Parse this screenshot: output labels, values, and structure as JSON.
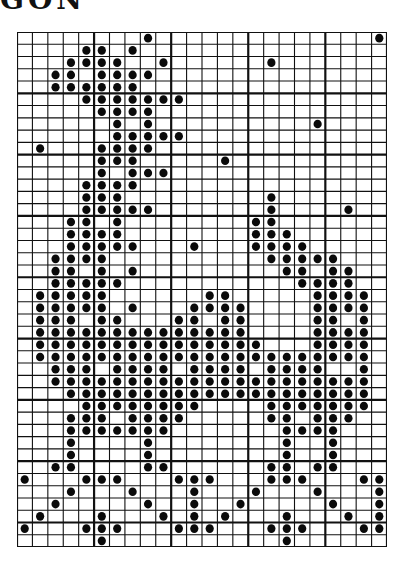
{
  "title": "GON",
  "grid": {
    "columns": 24,
    "rows": 42,
    "major_every": 5,
    "line_color": "#111111",
    "dot_color": "#0a0a0a",
    "background": "#ffffff"
  },
  "pattern": {
    "description": "Cross-stitch chart; each entry lists the column indices (0-based) of filled stitches for that row.",
    "rows": [
      [
        8,
        23
      ],
      [
        4,
        5,
        7
      ],
      [
        3,
        4,
        5,
        6,
        9,
        16
      ],
      [
        2,
        3,
        5,
        6,
        7,
        8
      ],
      [
        2,
        3,
        4,
        5,
        6,
        7
      ],
      [
        4,
        5,
        6,
        7,
        8,
        9,
        10
      ],
      [
        5,
        6,
        7,
        8
      ],
      [
        6,
        8,
        19
      ],
      [
        6,
        7,
        8,
        9,
        10
      ],
      [
        1,
        5,
        6,
        7,
        8
      ],
      [
        5,
        6,
        7,
        13
      ],
      [
        5,
        7,
        8,
        9
      ],
      [
        4,
        5,
        6,
        7
      ],
      [
        4,
        5,
        6,
        16
      ],
      [
        4,
        5,
        6,
        7,
        8,
        16,
        21
      ],
      [
        3,
        4,
        6,
        15,
        16
      ],
      [
        3,
        4,
        5,
        6,
        15,
        16,
        17
      ],
      [
        3,
        4,
        5,
        6,
        7,
        11,
        15,
        16,
        17,
        18
      ],
      [
        2,
        3,
        4,
        5,
        16,
        17,
        18,
        19,
        20
      ],
      [
        2,
        3,
        5,
        7,
        17,
        18,
        20,
        21
      ],
      [
        2,
        3,
        4,
        5,
        6,
        18,
        19,
        20,
        21
      ],
      [
        1,
        2,
        3,
        4,
        5,
        12,
        13,
        19,
        20,
        21,
        22
      ],
      [
        1,
        2,
        3,
        4,
        5,
        7,
        11,
        12,
        13,
        14,
        19,
        20,
        21,
        22
      ],
      [
        1,
        2,
        3,
        5,
        6,
        10,
        11,
        13,
        14,
        19,
        20,
        22
      ],
      [
        1,
        2,
        3,
        4,
        5,
        6,
        7,
        8,
        9,
        10,
        11,
        12,
        13,
        14,
        19,
        20,
        21,
        22
      ],
      [
        1,
        2,
        3,
        4,
        5,
        6,
        7,
        8,
        9,
        10,
        11,
        12,
        13,
        14,
        15,
        19,
        20,
        21,
        22
      ],
      [
        1,
        2,
        3,
        4,
        5,
        6,
        7,
        8,
        9,
        10,
        11,
        12,
        13,
        14,
        15,
        16,
        17,
        18,
        19,
        20,
        21,
        22
      ],
      [
        2,
        3,
        4,
        6,
        7,
        8,
        9,
        11,
        12,
        13,
        14,
        16,
        17,
        18,
        19,
        22
      ],
      [
        2,
        3,
        4,
        5,
        6,
        7,
        8,
        9,
        10,
        11,
        12,
        13,
        14,
        15,
        16,
        17,
        18,
        19,
        20,
        21,
        22
      ],
      [
        3,
        4,
        5,
        6,
        7,
        8,
        9,
        10,
        11,
        12,
        13,
        14,
        15,
        16,
        17,
        18,
        19,
        20,
        21,
        22
      ],
      [
        4,
        5,
        6,
        7,
        8,
        9,
        10,
        11,
        16,
        17,
        18,
        19,
        20,
        21,
        22
      ],
      [
        3,
        4,
        5,
        7,
        8,
        9,
        10,
        16,
        17,
        19,
        20,
        21
      ],
      [
        3,
        4,
        5,
        6,
        7,
        8,
        9,
        17,
        18,
        19,
        20
      ],
      [
        3,
        8,
        17,
        20
      ],
      [
        3,
        8,
        17,
        20
      ],
      [
        2,
        3,
        8,
        9,
        16,
        17,
        19,
        20
      ],
      [
        0,
        4,
        5,
        6,
        10,
        11,
        12,
        16,
        17,
        18,
        22,
        23
      ],
      [
        3,
        7,
        11,
        15,
        19,
        23
      ],
      [
        2,
        8,
        11,
        14,
        20,
        23
      ],
      [
        1,
        5,
        9,
        11,
        13,
        17,
        21,
        23
      ],
      [
        0,
        4,
        5,
        6,
        10,
        11,
        12,
        16,
        17,
        18,
        22,
        23
      ],
      [
        5,
        17
      ]
    ]
  }
}
